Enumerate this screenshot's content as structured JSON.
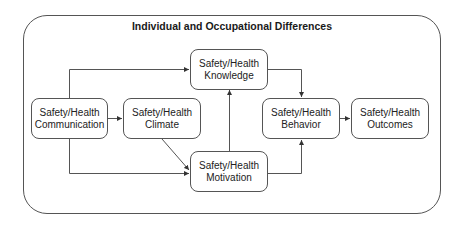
{
  "diagram": {
    "title": "Individual and Occupational Differences",
    "colors": {
      "stroke": "#555555",
      "text": "#1a1a1a",
      "background": "#ffffff"
    },
    "nodes": {
      "communication": {
        "line1": "Safety/Health",
        "line2": "Communication"
      },
      "climate": {
        "line1": "Safety/Health",
        "line2": "Climate"
      },
      "knowledge": {
        "line1": "Safety/Health",
        "line2": "Knowledge"
      },
      "motivation": {
        "line1": "Safety/Health",
        "line2": "Motivation"
      },
      "behavior": {
        "line1": "Safety/Health",
        "line2": "Behavior"
      },
      "outcomes": {
        "line1": "Safety/Health",
        "line2": "Outcomes"
      }
    },
    "edges": [
      {
        "from": "communication",
        "to": "climate"
      },
      {
        "from": "communication",
        "to": "knowledge"
      },
      {
        "from": "communication",
        "to": "motivation"
      },
      {
        "from": "climate",
        "to": "motivation"
      },
      {
        "from": "motivation",
        "to": "knowledge"
      },
      {
        "from": "knowledge",
        "to": "behavior"
      },
      {
        "from": "motivation",
        "to": "behavior"
      },
      {
        "from": "behavior",
        "to": "outcomes"
      }
    ]
  }
}
